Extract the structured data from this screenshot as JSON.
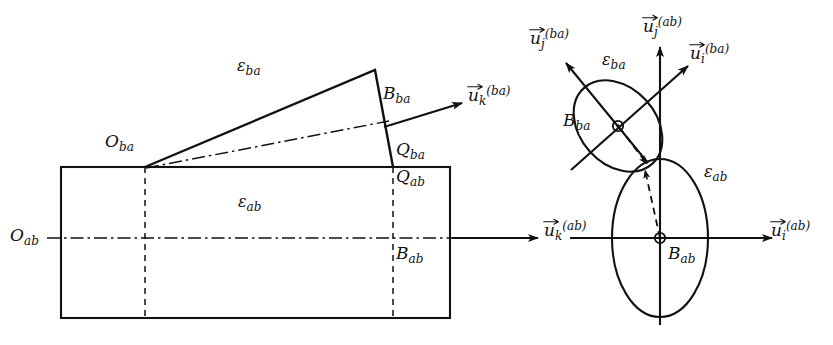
{
  "figure": {
    "background_color": "#ffffff",
    "stroke_color": "#111111",
    "width": 833,
    "height": 345
  },
  "left_diagram": {
    "name": "planar-side-view",
    "labels": {
      "O_ba": {
        "base": "O",
        "sub": "ba"
      },
      "O_ab": {
        "base": "O",
        "sub": "ab"
      },
      "B_ba": {
        "base": "B",
        "sub": "ba"
      },
      "B_ab": {
        "base": "B",
        "sub": "ab"
      },
      "Q_ba": {
        "base": "Q",
        "sub": "ba"
      },
      "Q_ab": {
        "base": "Q",
        "sub": "ab"
      },
      "eps_ba": {
        "base": "ε",
        "sub": "ba"
      },
      "eps_ab": {
        "base": "ε",
        "sub": "ab"
      },
      "u_k_ba": {
        "base": "u",
        "sub": "k",
        "sup": "(ba)"
      },
      "u_k_ab": {
        "base": "u",
        "sub": "k",
        "sup": "(ab)"
      }
    }
  },
  "right_diagram": {
    "name": "contact-frame-view",
    "labels": {
      "B_ba": {
        "base": "B",
        "sub": "ba"
      },
      "B_ab": {
        "base": "B",
        "sub": "ab"
      },
      "eps_ba": {
        "base": "ε",
        "sub": "ba"
      },
      "eps_ab": {
        "base": "ε",
        "sub": "ab"
      },
      "u_j_ba": {
        "base": "u",
        "sub": "j",
        "sup": "(ba)"
      },
      "u_j_ab": {
        "base": "u",
        "sub": "j",
        "sup": "(ab)"
      },
      "u_i_ba": {
        "base": "u",
        "sub": "i",
        "sup": "(ba)"
      },
      "u_i_ab": {
        "base": "u",
        "sub": "i",
        "sup": "(ab)"
      },
      "u_k_ab": {
        "base": "u",
        "sub": "k",
        "sup": "(ab)"
      }
    }
  }
}
